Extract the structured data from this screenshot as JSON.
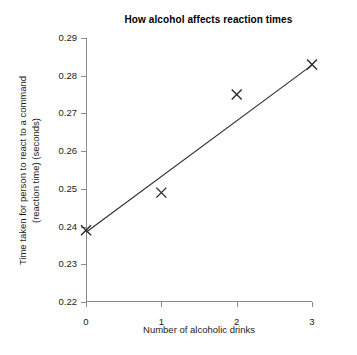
{
  "chart_data": {
    "type": "scatter",
    "title": "How alcohol affects reaction times",
    "xlabel": "Number of alcoholic drinks",
    "ylabel_line1": "Time taken for person to react to a command",
    "ylabel_line2": "(reaction time) (seconds)",
    "x": [
      0,
      1,
      2,
      3
    ],
    "values": [
      0.239,
      0.249,
      0.275,
      0.283
    ],
    "series": [
      {
        "name": "Reaction time",
        "marker": "x-cross",
        "values": [
          0.239,
          0.249,
          0.275,
          0.283
        ]
      },
      {
        "name": "Line of best fit",
        "marker": "line",
        "x_endpoints": [
          0,
          3
        ],
        "y_endpoints": [
          0.2385,
          0.2828
        ]
      }
    ],
    "xlim": [
      0,
      3
    ],
    "ylim": [
      0.22,
      0.29
    ],
    "xticks": [
      "0",
      "1",
      "2",
      "3"
    ],
    "yticks": [
      "0.22",
      "0.23",
      "0.24",
      "0.25",
      "0.26",
      "0.27",
      "0.28",
      "0.29"
    ],
    "grid": false,
    "legend": "none",
    "colors": {
      "axis": "#8a8a8a",
      "line": "#2b2b2b",
      "marker": "#2b2b2b",
      "text": "#1a1a1a",
      "background": "#ffffff"
    }
  }
}
